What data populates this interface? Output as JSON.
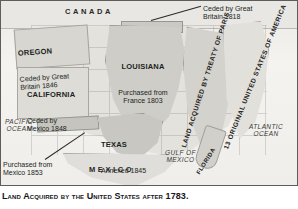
{
  "caption": "Land Acquired by the United States after 1783.",
  "map": {
    "regions": [
      {
        "id": "canada",
        "name": "CANADA"
      },
      {
        "id": "oregon",
        "title": "OREGON",
        "sub": "Ceded by Great\nBritain 1846"
      },
      {
        "id": "california",
        "title": "CALIFORNIA",
        "sub": "Ceded by\nMexico 1848"
      },
      {
        "id": "louisiana",
        "title": "LOUISIANA",
        "sub": "Purchased from\nFrance 1803"
      },
      {
        "id": "texas",
        "title": "TEXAS",
        "sub": "Annexed 1845"
      },
      {
        "id": "cession_1818",
        "sub": "Ceded by Great\nBritain 1818"
      },
      {
        "id": "gadsden",
        "sub": "Purchased from\nMexico 1853"
      },
      {
        "id": "treaty_of_paris",
        "title": "LAND ACQUIRED BY\nTREATY OF PARIS"
      },
      {
        "id": "thirteen_colonies",
        "title": "13 ORIGINAL UNITED STATES OF AMERICA"
      },
      {
        "id": "florida",
        "title": "FLORIDA"
      },
      {
        "id": "mexico",
        "name": "MEXICO"
      }
    ],
    "water_bodies": [
      {
        "id": "pacific",
        "name": "PACIFIC\nOCEAN"
      },
      {
        "id": "atlantic",
        "name": "ATLANTIC\nOCEAN"
      },
      {
        "id": "gulf",
        "name": "GULF OF\nMEXICO"
      }
    ],
    "colors": {
      "frame_border": "#5d5d5d",
      "land_base": "#e4e2dd",
      "land_shaded": "#cfcdc7",
      "land_dark": "#c9c7c1",
      "ocean_bg": "#f2f1ee",
      "text": "#201f1d"
    }
  }
}
